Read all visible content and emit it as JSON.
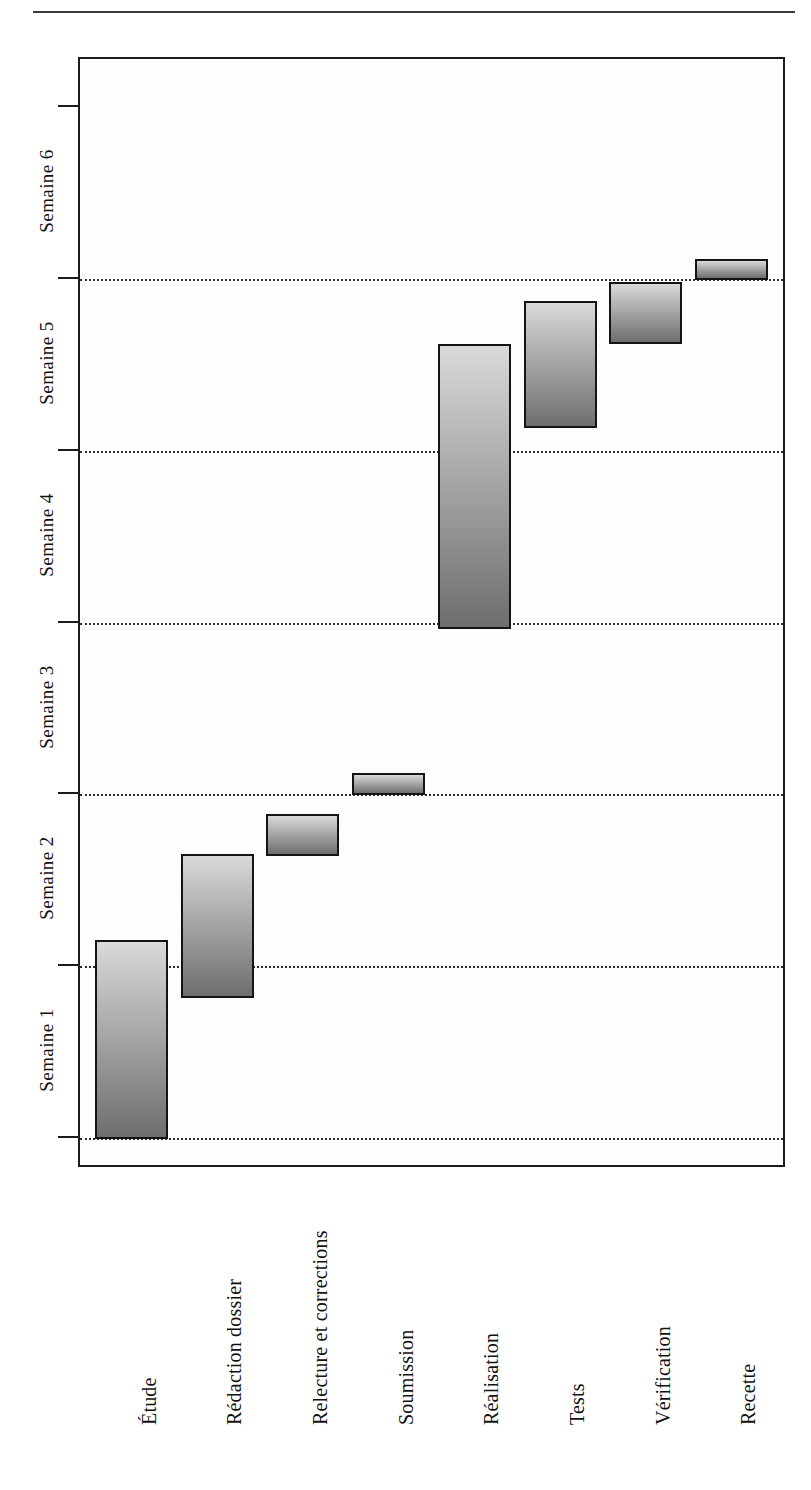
{
  "figure": {
    "kind": "gantt-chart",
    "language": "fr",
    "top_rule": "horizontal-rule"
  },
  "chart_data": {
    "type": "bar",
    "orientation": "vertical-gantt",
    "title": "",
    "xlabel": "",
    "ylabel": "",
    "categories": [
      "Étude",
      "Rédaction dossier",
      "Relecture et corrections",
      "Soumission",
      "Réalisation",
      "Tests",
      "Vérification",
      "Recette"
    ],
    "tick_labels": [
      "Semaine 1",
      "Semaine 2",
      "Semaine 3",
      "Semaine 4",
      "Semaine 5",
      "Semaine 6"
    ],
    "ylim": [
      0,
      6.2
    ],
    "grid": true,
    "legend": "none",
    "bar_color_light": "#d9d9d9",
    "bar_color_dark": "#6e6e6e",
    "bar_border_color": "#141414",
    "tasks": [
      {
        "name": "Étude",
        "start_week": 0.0,
        "end_week": 1.16,
        "duration_weeks": 1.16
      },
      {
        "name": "Rédaction dossier",
        "start_week": 0.82,
        "end_week": 1.66,
        "duration_weeks": 0.84
      },
      {
        "name": "Relecture et corrections",
        "start_week": 1.65,
        "end_week": 1.89,
        "duration_weeks": 0.24
      },
      {
        "name": "Soumission",
        "start_week": 2.0,
        "end_week": 2.13,
        "duration_weeks": 0.13
      },
      {
        "name": "Réalisation",
        "start_week": 2.97,
        "end_week": 4.63,
        "duration_weeks": 1.66
      },
      {
        "name": "Tests",
        "start_week": 4.14,
        "end_week": 4.88,
        "duration_weeks": 0.74
      },
      {
        "name": "Vérification",
        "start_week": 4.63,
        "end_week": 4.99,
        "duration_weeks": 0.36
      },
      {
        "name": "Recette",
        "start_week": 5.0,
        "end_week": 5.12,
        "duration_weeks": 0.12
      }
    ]
  }
}
